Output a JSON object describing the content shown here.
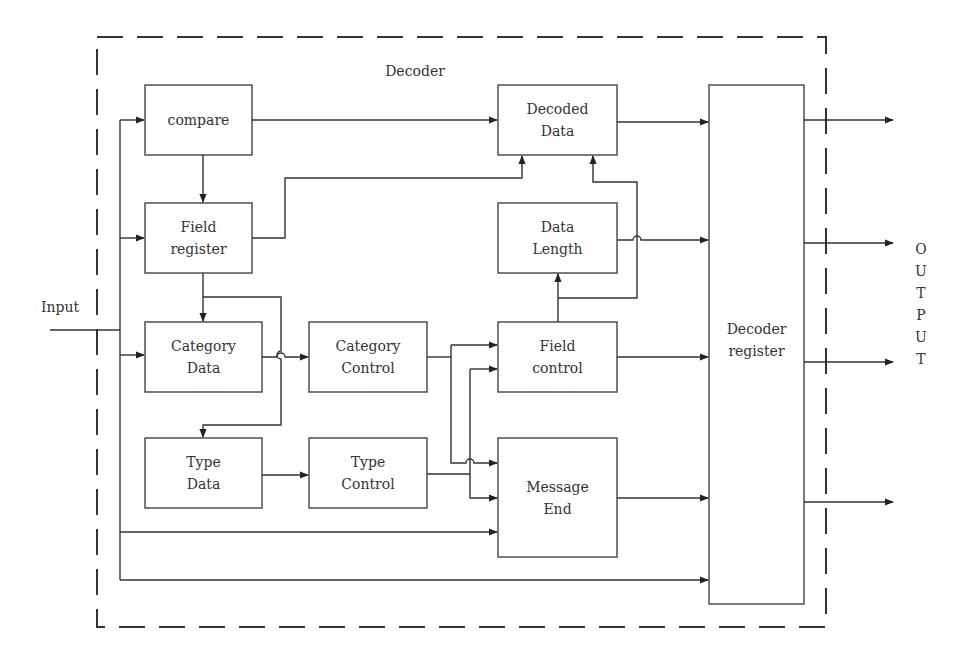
{
  "diagram": {
    "container_label": "Decoder",
    "input_label": "Input",
    "output_label": "OUTPUT",
    "output_letters": [
      "O",
      "U",
      "T",
      "P",
      "U",
      "T"
    ],
    "blocks": {
      "compare": "compare",
      "field_register": "Field\nregister",
      "category_data": "Category\nData",
      "type_data": "Type\nData",
      "category_control": "Category\nControl",
      "type_control": "Type\nControl",
      "decoded_data": "Decoded\nData",
      "data_length": "Data\nLength",
      "field_control": "Field\ncontrol",
      "message_end": "Message\nEnd",
      "decoder_register": "Decoder\nregister"
    },
    "connections": [
      {
        "from": "Input",
        "to": "compare"
      },
      {
        "from": "Input",
        "to": "Field register"
      },
      {
        "from": "Input",
        "to": "Category Data"
      },
      {
        "from": "Input",
        "to": "Message End"
      },
      {
        "from": "Input",
        "to": "Decoder register"
      },
      {
        "from": "compare",
        "to": "Decoded Data"
      },
      {
        "from": "compare",
        "to": "Field register"
      },
      {
        "from": "Field register",
        "to": "Decoded Data"
      },
      {
        "from": "Field register",
        "to": "Category Data"
      },
      {
        "from": "Field register",
        "to": "Type Data"
      },
      {
        "from": "Category Data",
        "to": "Category Control"
      },
      {
        "from": "Type Data",
        "to": "Type Control"
      },
      {
        "from": "Category Control",
        "to": "Field control"
      },
      {
        "from": "Category Control",
        "to": "Message End"
      },
      {
        "from": "Type Control",
        "to": "Field control"
      },
      {
        "from": "Type Control",
        "to": "Message End"
      },
      {
        "from": "Field control",
        "to": "Data Length"
      },
      {
        "from": "Field control",
        "to": "Decoded Data"
      },
      {
        "from": "Field control",
        "to": "Decoder register"
      },
      {
        "from": "Decoded Data",
        "to": "Decoder register"
      },
      {
        "from": "Data Length",
        "to": "Decoder register"
      },
      {
        "from": "Message End",
        "to": "Decoder register"
      },
      {
        "from": "Decoder register",
        "to": "OUTPUT"
      }
    ]
  }
}
